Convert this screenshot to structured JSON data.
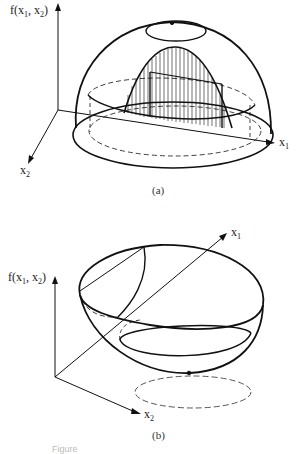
{
  "figure": {
    "panel_a": {
      "ylabel": "f(x",
      "ylabel_sub1": "1",
      "ylabel_mid": ", x",
      "ylabel_sub2": "2",
      "ylabel_end": ")",
      "x1_label": "x",
      "x1_sub": "1",
      "x2_label": "x",
      "x2_sub": "2",
      "caption": "(a)",
      "description": "Concave dome-shaped surface f(x1, x2) with a hatched vertical cross-section (parabolic slice) along x1 direction"
    },
    "panel_b": {
      "ylabel": "f(x",
      "ylabel_sub1": "1",
      "ylabel_mid": ", x",
      "ylabel_sub2": "2",
      "ylabel_end": ")",
      "x1_label": "x",
      "x1_sub": "1",
      "x2_label": "x",
      "x2_sub": "2",
      "caption": "(b)",
      "description": "Convex bowl-shaped surface f(x1, x2) with minimum point projected as dashed ellipse on the x1-x2 plane"
    },
    "figure_caption_partial": "Figure"
  }
}
